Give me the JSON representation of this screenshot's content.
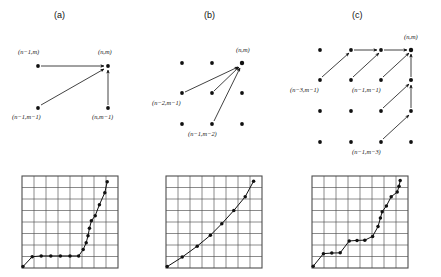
{
  "figure": {
    "width": 441,
    "height": 277,
    "background": "#ffffff",
    "ink_color": "#111111",
    "grid_color": "#4d4d4d",
    "panels": [
      {
        "id": "a",
        "caption": "(a)"
      },
      {
        "id": "b",
        "caption": "(b)"
      },
      {
        "id": "c",
        "caption": "(c)"
      }
    ]
  },
  "panel_a": {
    "caption": "(a)",
    "lattice": {
      "type": "scatter",
      "dots": [
        {
          "id": "n-1,m",
          "x": 38,
          "y": 66
        },
        {
          "id": "n,m",
          "x": 108,
          "y": 66
        },
        {
          "id": "n-1,m-1",
          "x": 38,
          "y": 108
        },
        {
          "id": "n,m-1",
          "x": 108,
          "y": 108
        }
      ]
    },
    "arrows": [
      {
        "from": "n-1,m",
        "to": "n,m"
      },
      {
        "from": "n-1,m-1",
        "to": "n,m"
      },
      {
        "from": "n,m-1",
        "to": "n,m"
      }
    ],
    "labels": [
      {
        "text": "(n-1,m)",
        "html": "(<i>n</i>&#8722;1,<i>m</i>)",
        "x": 18,
        "y": 48
      },
      {
        "text": "(n,m)",
        "html": "(<i>n</i>,<i>m</i>)",
        "x": 98,
        "y": 48
      },
      {
        "text": "(n-1,m-1)",
        "html": "(<i>n</i>&#8722;1,<i>m</i>&#8722;1)",
        "x": 12,
        "y": 113
      },
      {
        "text": "(n,m-1)",
        "html": "(<i>n</i>,<i>m</i>&#8722;1)",
        "x": 92,
        "y": 113
      }
    ]
  },
  "panel_b": {
    "caption": "(b)",
    "lattice": {
      "type": "scatter",
      "dots": [
        {
          "id": "n-2,m",
          "x": 182,
          "y": 63
        },
        {
          "id": "n-1,m",
          "x": 212,
          "y": 63
        },
        {
          "id": "n,m",
          "x": 242,
          "y": 63
        },
        {
          "id": "n-2,m-1",
          "x": 182,
          "y": 93
        },
        {
          "id": "n-1,m-1",
          "x": 212,
          "y": 93
        },
        {
          "id": "n,m-1",
          "x": 242,
          "y": 93
        },
        {
          "id": "n-2,m-2",
          "x": 182,
          "y": 124
        },
        {
          "id": "n-1,m-2",
          "x": 212,
          "y": 124
        },
        {
          "id": "n,m-2",
          "x": 242,
          "y": 124
        }
      ]
    },
    "arrows": [
      {
        "from": "n-2,m-1",
        "to": "n,m"
      },
      {
        "from": "n-1,m-1",
        "to": "n,m"
      },
      {
        "from": "n-1,m-2",
        "to": "n,m"
      }
    ],
    "labels": [
      {
        "text": "(n,m)",
        "html": "(<i>n</i>,<i>m</i>)",
        "x": 236,
        "y": 46
      },
      {
        "text": "(n-2,m-1)",
        "html": "(<i>n</i>&#8722;2,<i>m</i>&#8722;1)",
        "x": 152,
        "y": 99
      },
      {
        "text": "(n-1,m-2)",
        "html": "(<i>n</i>&#8722;1,<i>m</i>&#8722;2)",
        "x": 188,
        "y": 130
      }
    ]
  },
  "panel_c": {
    "caption": "(c)",
    "lattice": {
      "type": "scatter",
      "dots": [
        {
          "id": "n-3,m",
          "x": 320,
          "y": 50
        },
        {
          "id": "n-2,m",
          "x": 351,
          "y": 50
        },
        {
          "id": "n-1,m",
          "x": 381,
          "y": 50
        },
        {
          "id": "n,m",
          "x": 411,
          "y": 50
        },
        {
          "id": "n-3,m-1",
          "x": 320,
          "y": 80
        },
        {
          "id": "n-2,m-1",
          "x": 351,
          "y": 80
        },
        {
          "id": "n-1,m-1",
          "x": 381,
          "y": 80
        },
        {
          "id": "n,m-1",
          "x": 411,
          "y": 80
        },
        {
          "id": "n-3,m-2",
          "x": 320,
          "y": 111
        },
        {
          "id": "n-2,m-2",
          "x": 351,
          "y": 111
        },
        {
          "id": "n-1,m-2",
          "x": 381,
          "y": 111
        },
        {
          "id": "n,m-2",
          "x": 411,
          "y": 111
        },
        {
          "id": "n-3,m-3",
          "x": 320,
          "y": 142
        },
        {
          "id": "n-2,m-3",
          "x": 351,
          "y": 142
        },
        {
          "id": "n-1,m-3",
          "x": 381,
          "y": 142
        },
        {
          "id": "n,m-3",
          "x": 411,
          "y": 142
        }
      ]
    },
    "arrows": [
      {
        "from": "n-3,m-1",
        "to": "n-2,m"
      },
      {
        "from": "n-2,m",
        "to": "n-1,m"
      },
      {
        "from": "n-2,m-1",
        "to": "n-1,m"
      },
      {
        "from": "n-1,m",
        "to": "n,m"
      },
      {
        "from": "n-1,m-1",
        "to": "n,m"
      },
      {
        "from": "n,m-1",
        "to": "n,m"
      },
      {
        "from": "n-1,m-2",
        "to": "n,m-1"
      },
      {
        "from": "n,m-2",
        "to": "n,m-1"
      },
      {
        "from": "n-1,m-3",
        "to": "n,m-2"
      }
    ],
    "labels": [
      {
        "text": "(n,m)",
        "html": "(<i>n</i>,<i>m</i>)",
        "x": 404,
        "y": 33
      },
      {
        "text": "(n-3,m-1)",
        "html": "(<i>n</i>&#8722;3,<i>m</i>&#8722;1)",
        "x": 290,
        "y": 86
      },
      {
        "text": "(n-1,m-1)",
        "html": "(<i>n</i>&#8722;1,<i>m</i>&#8722;1)",
        "x": 352,
        "y": 86
      },
      {
        "text": "(n-1,m-3)",
        "html": "(<i>n</i>&#8722;1,<i>m</i>&#8722;3)",
        "x": 352,
        "y": 148
      }
    ]
  },
  "plot_a": {
    "chart_data": {
      "type": "line",
      "title": "",
      "xlabel": "",
      "ylabel": "",
      "grid": true,
      "grid_cols": 8,
      "grid_rows": 8,
      "xlim": [
        0,
        8
      ],
      "ylim": [
        0,
        8
      ],
      "markers": true,
      "x": [
        0.08,
        0.85,
        1.6,
        2.4,
        3.2,
        4.0,
        4.72,
        5.1,
        5.35,
        5.5,
        5.62,
        5.78,
        6.1,
        6.45,
        6.9,
        7.1
      ],
      "y": [
        0.12,
        0.98,
        1.05,
        1.05,
        1.05,
        1.05,
        1.05,
        1.6,
        2.2,
        2.8,
        3.45,
        4.1,
        4.55,
        5.5,
        6.55,
        7.5
      ]
    }
  },
  "plot_b": {
    "chart_data": {
      "type": "line",
      "title": "",
      "xlabel": "",
      "ylabel": "",
      "grid": true,
      "grid_cols": 8,
      "grid_rows": 8,
      "xlim": [
        0,
        8
      ],
      "ylim": [
        0,
        8
      ],
      "markers": true,
      "x": [
        0.1,
        1.35,
        2.6,
        3.7,
        4.65,
        5.65,
        6.6,
        7.3
      ],
      "y": [
        0.12,
        0.95,
        1.9,
        2.85,
        3.85,
        5.0,
        6.2,
        7.55
      ]
    }
  },
  "plot_c": {
    "chart_data": {
      "type": "line",
      "title": "",
      "xlabel": "",
      "ylabel": "",
      "grid": true,
      "grid_cols": 8,
      "grid_rows": 8,
      "xlim": [
        0,
        8
      ],
      "ylim": [
        0,
        8
      ],
      "markers": true,
      "x": [
        0.1,
        0.95,
        1.65,
        2.35,
        3.1,
        3.75,
        4.4,
        5.05,
        5.5,
        5.7,
        5.85,
        6.2,
        6.6,
        7.1,
        7.25,
        7.35
      ],
      "y": [
        0.15,
        1.25,
        1.3,
        1.32,
        2.35,
        2.4,
        2.42,
        2.75,
        3.6,
        4.35,
        4.9,
        5.4,
        6.2,
        6.6,
        7.1,
        7.6
      ]
    }
  }
}
